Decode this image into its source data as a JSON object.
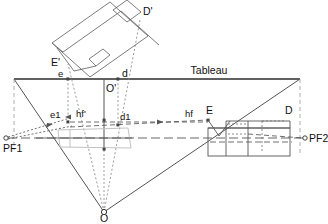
{
  "diagram": {
    "title_label": "Tableau",
    "type": "perspective-construction-drawing",
    "colors": {
      "ink": "#333333",
      "ink_dark": "#111111",
      "construction_gray": "#777777",
      "object_gray": "#bbbbbb",
      "background": "#ffffff"
    },
    "labels": {
      "tableau": "Tableau",
      "d_prime": "D'",
      "e_prime": "E'",
      "o_prime": "O'",
      "e_small": "e",
      "d_small": "d",
      "e1": "e1",
      "hf_prime": "hf'",
      "d1": "d1",
      "hf": "hf",
      "E": "E",
      "D": "D",
      "PF1": "PF1",
      "PF2": "PF2",
      "O": "O"
    },
    "points": [
      {
        "name": "O",
        "x": 104,
        "y": 212,
        "label": "O"
      },
      {
        "name": "O-prime",
        "x": 104,
        "y": 79,
        "label": "O'"
      },
      {
        "name": "e-small",
        "x": 68,
        "y": 79,
        "label": "e"
      },
      {
        "name": "d-small",
        "x": 118,
        "y": 79,
        "label": "d"
      },
      {
        "name": "E-prime",
        "x": 68,
        "y": 62,
        "label": "E'"
      },
      {
        "name": "D-prime",
        "x": 140,
        "y": 17,
        "label": "D'"
      },
      {
        "name": "e1",
        "x": 68,
        "y": 115,
        "label": "e1"
      },
      {
        "name": "d1",
        "x": 118,
        "y": 123,
        "label": "d1"
      },
      {
        "name": "PF1",
        "x": 6,
        "y": 138,
        "label": "PF1"
      },
      {
        "name": "PF2",
        "x": 305,
        "y": 138,
        "label": "PF2"
      },
      {
        "name": "E-right",
        "x": 208,
        "y": 115,
        "label": "E"
      },
      {
        "name": "D-right",
        "x": 290,
        "y": 115,
        "label": "D"
      }
    ],
    "geometry": {
      "tableau_line": {
        "x1": 14,
        "y1": 79,
        "x2": 300,
        "y2": 79
      },
      "horizon_line": {
        "x1": 6,
        "y1": 138,
        "x2": 305,
        "y2": 138
      },
      "triangle": [
        [
          14,
          79
        ],
        [
          300,
          79
        ],
        [
          104,
          212
        ]
      ],
      "pf1_marker_r": 2.2,
      "pf2_marker_r": 2.2
    }
  }
}
